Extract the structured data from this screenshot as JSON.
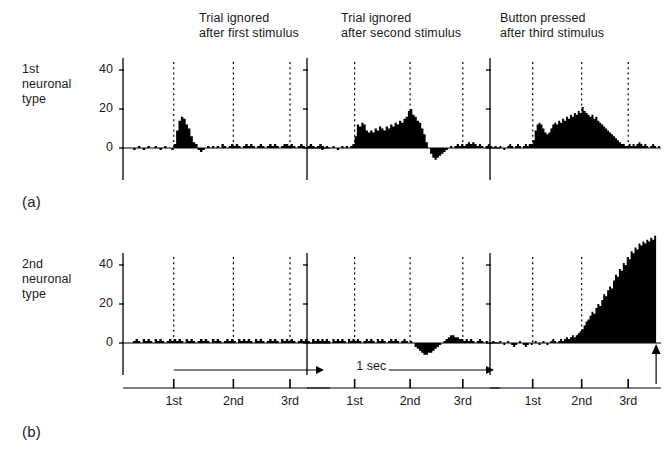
{
  "figure": {
    "panel_a_label": "(a)",
    "panel_b_label": "(b)",
    "row_labels": {
      "first": "1st\nneuronal\ntype",
      "second": "2nd\nneuronal\ntype"
    },
    "column_titles": [
      "Trial ignored\nafter first stimulus",
      "Trial ignored\nafter second stimulus",
      "Button pressed\nafter third stimulus"
    ],
    "time_axis": {
      "tick_labels": [
        "1st",
        "2nd",
        "3rd"
      ],
      "scale_label": "1 sec"
    },
    "colors": {
      "ink": "#000000",
      "background": "#ffffff"
    }
  },
  "chart_data": [
    {
      "type": "bar",
      "title": "Trial ignored after first stimulus",
      "row": "1st neuronal type",
      "xlabel": "",
      "ylabel": "",
      "ylim": [
        -8,
        52
      ],
      "yticks": [
        0,
        20,
        40
      ],
      "ytick_labels": [
        "0",
        "20",
        "40"
      ],
      "grid": false,
      "stimulus_markers": [
        "1st",
        "2nd",
        "3rd"
      ],
      "stimulus_x": [
        0.0,
        1.0,
        1.95
      ],
      "x": [
        -0.72,
        -0.68,
        -0.64,
        -0.6,
        -0.56,
        -0.52,
        -0.48,
        -0.44,
        -0.4,
        -0.36,
        -0.32,
        -0.28,
        -0.24,
        -0.2,
        -0.16,
        -0.12,
        -0.08,
        -0.04,
        0.0,
        0.04,
        0.08,
        0.12,
        0.16,
        0.2,
        0.24,
        0.28,
        0.32,
        0.36,
        0.4,
        0.44,
        0.48,
        0.52,
        0.56,
        0.6,
        0.64,
        0.68,
        0.72,
        0.76,
        0.8,
        0.84,
        0.88,
        0.92,
        0.96,
        1.0,
        1.04,
        1.08,
        1.12,
        1.16,
        1.2,
        1.24,
        1.28,
        1.32,
        1.36,
        1.4,
        1.44,
        1.48,
        1.52,
        1.56,
        1.6,
        1.64,
        1.68,
        1.72,
        1.76,
        1.8,
        1.84,
        1.88,
        1.92,
        1.96,
        2.0,
        2.04,
        2.08,
        2.12,
        2.16,
        2.2,
        2.24,
        2.28,
        2.32,
        2.36,
        2.4,
        2.44,
        2.48,
        2.52,
        2.56,
        2.6
      ],
      "values": [
        0,
        -1,
        0,
        1,
        0,
        -1,
        0,
        1,
        0,
        0,
        1,
        0,
        -1,
        0,
        1,
        0,
        0,
        -1,
        2,
        9,
        14,
        16,
        15,
        12,
        10,
        6,
        3,
        2,
        -1,
        -2,
        -1,
        0,
        1,
        0,
        1,
        0,
        1,
        0,
        2,
        1,
        0,
        1,
        2,
        1,
        2,
        1,
        0,
        1,
        2,
        1,
        2,
        1,
        0,
        1,
        2,
        1,
        0,
        1,
        2,
        1,
        2,
        1,
        0,
        1,
        2,
        2,
        1,
        2,
        1,
        0,
        1,
        2,
        1,
        0,
        1,
        2,
        1,
        0,
        1,
        2,
        1,
        0,
        0
      ]
    },
    {
      "type": "bar",
      "title": "Trial ignored after second stimulus",
      "row": "1st neuronal type",
      "xlabel": "",
      "ylabel": "",
      "ylim": [
        -8,
        52
      ],
      "yticks": [
        0,
        20,
        40
      ],
      "ytick_labels": [
        "0",
        "20",
        "40"
      ],
      "grid": false,
      "stimulus_markers": [
        "1st",
        "2nd",
        "3rd"
      ],
      "stimulus_x": [
        0.0,
        1.0,
        1.95
      ],
      "x": [
        -0.72,
        -0.68,
        -0.64,
        -0.6,
        -0.56,
        -0.52,
        -0.48,
        -0.44,
        -0.4,
        -0.36,
        -0.32,
        -0.28,
        -0.24,
        -0.2,
        -0.16,
        -0.12,
        -0.08,
        -0.04,
        0.0,
        0.04,
        0.08,
        0.12,
        0.16,
        0.2,
        0.24,
        0.28,
        0.32,
        0.36,
        0.4,
        0.44,
        0.48,
        0.52,
        0.56,
        0.6,
        0.64,
        0.68,
        0.72,
        0.76,
        0.8,
        0.84,
        0.88,
        0.92,
        0.96,
        1.0,
        1.04,
        1.08,
        1.12,
        1.16,
        1.2,
        1.24,
        1.28,
        1.32,
        1.36,
        1.4,
        1.44,
        1.48,
        1.52,
        1.56,
        1.6,
        1.64,
        1.68,
        1.72,
        1.76,
        1.8,
        1.84,
        1.88,
        1.92,
        1.96,
        2.0,
        2.04,
        2.08,
        2.12,
        2.16,
        2.2,
        2.24,
        2.28,
        2.32,
        2.36,
        2.4,
        2.44,
        2.48,
        2.52,
        2.56,
        2.6
      ],
      "values": [
        0,
        1,
        0,
        -1,
        0,
        1,
        0,
        0,
        1,
        0,
        -1,
        0,
        1,
        0,
        1,
        0,
        1,
        2,
        6,
        12,
        11,
        13,
        12,
        9,
        8,
        9,
        8,
        10,
        9,
        11,
        10,
        9,
        11,
        10,
        12,
        11,
        13,
        12,
        14,
        13,
        15,
        16,
        19,
        20,
        17,
        16,
        14,
        13,
        10,
        7,
        3,
        0,
        -3,
        -5,
        -6,
        -5,
        -4,
        -3,
        -2,
        -1,
        0,
        1,
        0,
        1,
        2,
        1,
        2,
        1,
        2,
        3,
        2,
        3,
        2,
        1,
        2,
        1,
        0,
        1,
        2,
        1,
        0,
        1,
        0
      ]
    },
    {
      "type": "bar",
      "title": "Button pressed after third stimulus",
      "row": "1st neuronal type",
      "xlabel": "",
      "ylabel": "",
      "ylim": [
        -8,
        52
      ],
      "yticks": [
        0,
        20,
        40
      ],
      "ytick_labels": [
        "0",
        "20",
        "40"
      ],
      "grid": false,
      "stimulus_markers": [
        "1st",
        "2nd",
        "3rd"
      ],
      "stimulus_x": [
        0.0,
        1.0,
        1.95
      ],
      "x": [
        -0.72,
        -0.68,
        -0.64,
        -0.6,
        -0.56,
        -0.52,
        -0.48,
        -0.44,
        -0.4,
        -0.36,
        -0.32,
        -0.28,
        -0.24,
        -0.2,
        -0.16,
        -0.12,
        -0.08,
        -0.04,
        0.0,
        0.04,
        0.08,
        0.12,
        0.16,
        0.2,
        0.24,
        0.28,
        0.32,
        0.36,
        0.4,
        0.44,
        0.48,
        0.52,
        0.56,
        0.6,
        0.64,
        0.68,
        0.72,
        0.76,
        0.8,
        0.84,
        0.88,
        0.92,
        0.96,
        1.0,
        1.04,
        1.08,
        1.12,
        1.16,
        1.2,
        1.24,
        1.28,
        1.32,
        1.36,
        1.4,
        1.44,
        1.48,
        1.52,
        1.56,
        1.6,
        1.64,
        1.68,
        1.72,
        1.76,
        1.8,
        1.84,
        1.88,
        1.92,
        1.96,
        2.0,
        2.04,
        2.08,
        2.12,
        2.16,
        2.2,
        2.24,
        2.28,
        2.32,
        2.36,
        2.4,
        2.44,
        2.48,
        2.52,
        2.56,
        2.6
      ],
      "values": [
        0,
        1,
        0,
        -1,
        0,
        1,
        2,
        1,
        0,
        1,
        2,
        1,
        0,
        1,
        2,
        1,
        2,
        2,
        4,
        9,
        12,
        13,
        12,
        10,
        8,
        7,
        8,
        10,
        12,
        13,
        12,
        14,
        13,
        15,
        14,
        16,
        15,
        17,
        16,
        18,
        17,
        19,
        18,
        21,
        19,
        18,
        17,
        16,
        17,
        15,
        16,
        14,
        13,
        12,
        11,
        10,
        9,
        8,
        7,
        6,
        5,
        4,
        3,
        2,
        2,
        1,
        1,
        2,
        1,
        2,
        1,
        2,
        3,
        2,
        1,
        2,
        1,
        0,
        1,
        2,
        1,
        0,
        1,
        0
      ]
    },
    {
      "type": "bar",
      "title": "Trial ignored after first stimulus",
      "row": "2nd neuronal type",
      "xlabel": "",
      "ylabel": "",
      "ylim": [
        -8,
        52
      ],
      "yticks": [
        0,
        20,
        40
      ],
      "ytick_labels": [
        "0",
        "20",
        "40"
      ],
      "grid": false,
      "stimulus_markers": [
        "1st",
        "2nd",
        "3rd"
      ],
      "stimulus_x": [
        0.0,
        1.0,
        1.95
      ],
      "x": [
        -0.72,
        -0.68,
        -0.64,
        -0.6,
        -0.56,
        -0.52,
        -0.48,
        -0.44,
        -0.4,
        -0.36,
        -0.32,
        -0.28,
        -0.24,
        -0.2,
        -0.16,
        -0.12,
        -0.08,
        -0.04,
        0.0,
        0.04,
        0.08,
        0.12,
        0.16,
        0.2,
        0.24,
        0.28,
        0.32,
        0.36,
        0.4,
        0.44,
        0.48,
        0.52,
        0.56,
        0.6,
        0.64,
        0.68,
        0.72,
        0.76,
        0.8,
        0.84,
        0.88,
        0.92,
        0.96,
        1.0,
        1.04,
        1.08,
        1.12,
        1.16,
        1.2,
        1.24,
        1.28,
        1.32,
        1.36,
        1.4,
        1.44,
        1.48,
        1.52,
        1.56,
        1.6,
        1.64,
        1.68,
        1.72,
        1.76,
        1.8,
        1.84,
        1.88,
        1.92,
        1.96,
        2.0,
        2.04,
        2.08,
        2.12,
        2.16,
        2.2,
        2.24,
        2.28,
        2.32,
        2.36,
        2.4,
        2.44,
        2.48,
        2.52,
        2.56,
        2.6
      ],
      "values": [
        0,
        1,
        2,
        1,
        0,
        2,
        1,
        2,
        1,
        0,
        2,
        1,
        2,
        1,
        0,
        1,
        2,
        1,
        2,
        1,
        2,
        1,
        0,
        2,
        1,
        2,
        1,
        0,
        1,
        2,
        1,
        2,
        1,
        0,
        2,
        1,
        2,
        1,
        0,
        1,
        2,
        1,
        2,
        1,
        0,
        2,
        1,
        2,
        1,
        2,
        1,
        0,
        2,
        1,
        2,
        1,
        0,
        1,
        2,
        1,
        2,
        1,
        0,
        2,
        1,
        2,
        1,
        2,
        1,
        0,
        1,
        2,
        1,
        2,
        1,
        0,
        2,
        1,
        2,
        1,
        0,
        1,
        0,
        0
      ]
    },
    {
      "type": "bar",
      "title": "Trial ignored after second stimulus",
      "row": "2nd neuronal type",
      "xlabel": "",
      "ylabel": "",
      "ylim": [
        -8,
        52
      ],
      "yticks": [
        0,
        20,
        40
      ],
      "ytick_labels": [
        "0",
        "20",
        "40"
      ],
      "grid": false,
      "stimulus_markers": [
        "1st",
        "2nd",
        "3rd"
      ],
      "stimulus_x": [
        0.0,
        1.0,
        1.95
      ],
      "x": [
        -0.72,
        -0.68,
        -0.64,
        -0.6,
        -0.56,
        -0.52,
        -0.48,
        -0.44,
        -0.4,
        -0.36,
        -0.32,
        -0.28,
        -0.24,
        -0.2,
        -0.16,
        -0.12,
        -0.08,
        -0.04,
        0.0,
        0.04,
        0.08,
        0.12,
        0.16,
        0.2,
        0.24,
        0.28,
        0.32,
        0.36,
        0.4,
        0.44,
        0.48,
        0.52,
        0.56,
        0.6,
        0.64,
        0.68,
        0.72,
        0.76,
        0.8,
        0.84,
        0.88,
        0.92,
        0.96,
        1.0,
        1.04,
        1.08,
        1.12,
        1.16,
        1.2,
        1.24,
        1.28,
        1.32,
        1.36,
        1.4,
        1.44,
        1.48,
        1.52,
        1.56,
        1.6,
        1.64,
        1.68,
        1.72,
        1.76,
        1.8,
        1.84,
        1.88,
        1.92,
        1.96,
        2.0,
        2.04,
        2.08,
        2.12,
        2.16,
        2.2,
        2.24,
        2.28,
        2.32,
        2.36,
        2.4,
        2.44,
        2.48,
        2.52,
        2.56,
        2.6
      ],
      "values": [
        0,
        1,
        0,
        2,
        1,
        2,
        1,
        0,
        2,
        1,
        2,
        1,
        2,
        1,
        0,
        2,
        1,
        2,
        1,
        2,
        1,
        0,
        1,
        2,
        1,
        2,
        1,
        0,
        2,
        1,
        2,
        1,
        0,
        1,
        2,
        1,
        2,
        1,
        0,
        1,
        2,
        1,
        0,
        1,
        0,
        -2,
        -3,
        -4,
        -5,
        -6,
        -6,
        -5,
        -5,
        -4,
        -3,
        -2,
        -1,
        0,
        1,
        2,
        3,
        4,
        4,
        3,
        3,
        2,
        2,
        1,
        2,
        1,
        2,
        1,
        0,
        1,
        2,
        1,
        0,
        1,
        0,
        0,
        1,
        0,
        0
      ]
    },
    {
      "type": "bar",
      "title": "Button pressed after third stimulus",
      "row": "2nd neuronal type",
      "xlabel": "",
      "ylabel": "",
      "ylim": [
        -8,
        52
      ],
      "yticks": [
        0,
        20,
        40
      ],
      "ytick_labels": [
        "0",
        "20",
        "40"
      ],
      "grid": false,
      "stimulus_markers": [
        "1st",
        "2nd",
        "3rd"
      ],
      "stimulus_x": [
        0.0,
        1.0,
        1.95
      ],
      "button_press_marker": true,
      "x": [
        -0.72,
        -0.68,
        -0.64,
        -0.6,
        -0.56,
        -0.52,
        -0.48,
        -0.44,
        -0.4,
        -0.36,
        -0.32,
        -0.28,
        -0.24,
        -0.2,
        -0.16,
        -0.12,
        -0.08,
        -0.04,
        0.0,
        0.04,
        0.08,
        0.12,
        0.16,
        0.2,
        0.24,
        0.28,
        0.32,
        0.36,
        0.4,
        0.44,
        0.48,
        0.52,
        0.56,
        0.6,
        0.64,
        0.68,
        0.72,
        0.76,
        0.8,
        0.84,
        0.88,
        0.92,
        0.96,
        1.0,
        1.04,
        1.08,
        1.12,
        1.16,
        1.2,
        1.24,
        1.28,
        1.32,
        1.36,
        1.4,
        1.44,
        1.48,
        1.52,
        1.56,
        1.6,
        1.64,
        1.68,
        1.72,
        1.76,
        1.8,
        1.84,
        1.88,
        1.92,
        1.96,
        2.0,
        2.04,
        2.08,
        2.12,
        2.16,
        2.2,
        2.24,
        2.28,
        2.32,
        2.36,
        2.4,
        2.44,
        2.48
      ],
      "values": [
        0,
        1,
        0,
        -1,
        0,
        1,
        0,
        -1,
        -2,
        -1,
        0,
        1,
        0,
        -1,
        -2,
        -1,
        0,
        -1,
        0,
        1,
        0,
        -1,
        0,
        1,
        0,
        -1,
        0,
        1,
        2,
        1,
        0,
        1,
        2,
        1,
        2,
        3,
        2,
        3,
        4,
        3,
        4,
        5,
        6,
        7,
        9,
        11,
        12,
        14,
        16,
        15,
        18,
        20,
        19,
        22,
        25,
        24,
        27,
        29,
        28,
        32,
        35,
        34,
        38,
        37,
        41,
        40,
        44,
        43,
        47,
        46,
        49,
        48,
        51,
        50,
        52,
        51,
        53,
        52,
        54,
        53,
        55
      ]
    }
  ]
}
